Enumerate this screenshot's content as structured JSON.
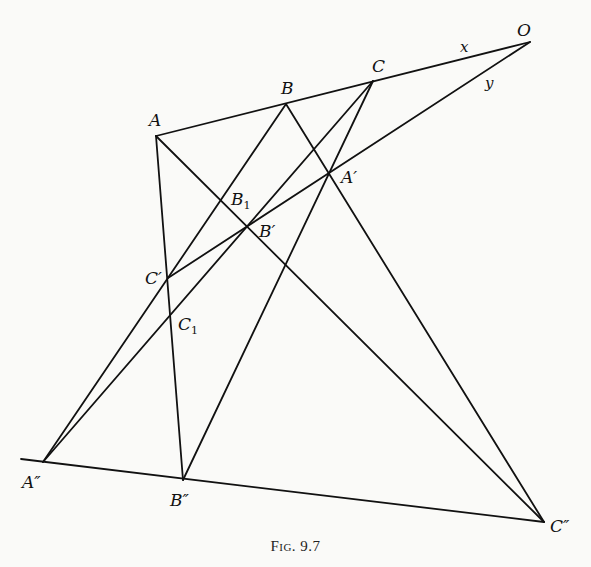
{
  "figure": {
    "caption": "Fig. 9.7"
  },
  "points": {
    "O": {
      "label": "O",
      "sub": ""
    },
    "A": {
      "label": "A",
      "sub": ""
    },
    "B": {
      "label": "B",
      "sub": ""
    },
    "C": {
      "label": "C",
      "sub": ""
    },
    "A1": {
      "label": "A′",
      "sub": ""
    },
    "B1p": {
      "label": "B′",
      "sub": ""
    },
    "C1p": {
      "label": "C′",
      "sub": ""
    },
    "B_1": {
      "label": "B",
      "sub": "1"
    },
    "C_1": {
      "label": "C",
      "sub": "1"
    },
    "A2": {
      "label": "A″",
      "sub": ""
    },
    "B2": {
      "label": "B″",
      "sub": ""
    },
    "C2": {
      "label": "C″",
      "sub": ""
    }
  },
  "lines": {
    "x": {
      "label": "x"
    },
    "y": {
      "label": "y"
    }
  },
  "segments": [
    {
      "name": "line-x-A-O",
      "from": "A",
      "to": "O"
    },
    {
      "name": "line-y-O-Cprime",
      "from": "O",
      "to": "C1p"
    },
    {
      "name": "line-A-Cdouble",
      "from": "A",
      "to": "C2"
    },
    {
      "name": "line-B-Cdouble",
      "from": "B",
      "to": "C2"
    },
    {
      "name": "line-A-Bdouble",
      "from": "A",
      "to": "B2"
    },
    {
      "name": "line-B-Adouble",
      "from": "B",
      "to": "A2"
    },
    {
      "name": "line-C-Adouble",
      "from": "C",
      "to": "A2"
    },
    {
      "name": "line-C-Bdouble",
      "from": "C",
      "to": "B2"
    },
    {
      "name": "line-Adouble-Cdouble",
      "from": "A2",
      "to": "C2"
    }
  ]
}
